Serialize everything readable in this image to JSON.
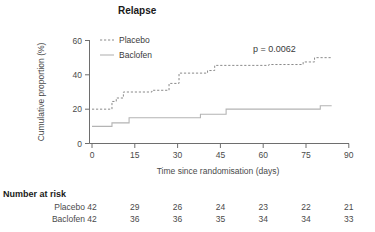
{
  "figure": {
    "title": "Relapse",
    "p_value_label": "p = 0.0062"
  },
  "axes": {
    "y_label": "Cumulative proportion (%)",
    "x_label": "Time since randomisation (days)",
    "y_ticks": [
      "0",
      "20",
      "40",
      "60"
    ],
    "x_ticks": [
      "0",
      "15",
      "30",
      "45",
      "60",
      "75",
      "90"
    ]
  },
  "legend": {
    "items": [
      {
        "label": "Placebo",
        "style": "dashed",
        "color": "#8a8a8a"
      },
      {
        "label": "Baclofen",
        "style": "solid",
        "color": "#b4b4b4"
      }
    ]
  },
  "risk_table": {
    "heading": "Number at risk",
    "rows": [
      {
        "label": "Placebo",
        "values": [
          "42",
          "29",
          "26",
          "24",
          "23",
          "22",
          "21"
        ]
      },
      {
        "label": "Baclofen",
        "values": [
          "42",
          "36",
          "36",
          "35",
          "34",
          "34",
          "33"
        ]
      }
    ]
  },
  "chart_data": {
    "type": "line",
    "subtype": "kaplan-meier-cumulative-incidence",
    "title": "Relapse",
    "xlabel": "Time since randomisation (days)",
    "ylabel": "Cumulative proportion (%)",
    "xlim": [
      0,
      90
    ],
    "ylim": [
      0,
      60
    ],
    "xticks": [
      0,
      15,
      30,
      45,
      60,
      75,
      90
    ],
    "yticks": [
      0,
      20,
      40,
      60
    ],
    "grid": false,
    "legend_position": "top-left-inside",
    "annotations": [
      {
        "text": "p = 0.0062",
        "x": 62,
        "y": 56
      }
    ],
    "series": [
      {
        "name": "Placebo",
        "style": "dashed",
        "color": "#8a8a8a",
        "steps": [
          [
            0,
            20.0
          ],
          [
            7,
            20.0
          ],
          [
            7,
            24.5
          ],
          [
            8.5,
            24.5
          ],
          [
            8.5,
            26.5
          ],
          [
            11,
            26.5
          ],
          [
            11,
            30.0
          ],
          [
            21,
            30.0
          ],
          [
            21,
            31.0
          ],
          [
            27,
            31.0
          ],
          [
            27,
            35.0
          ],
          [
            30.5,
            35.0
          ],
          [
            30.5,
            41.0
          ],
          [
            40.5,
            41.0
          ],
          [
            40.5,
            42.5
          ],
          [
            43,
            42.5
          ],
          [
            43,
            45.5
          ],
          [
            62,
            45.5
          ],
          [
            62,
            46.0
          ],
          [
            74,
            46.0
          ],
          [
            74,
            47.5
          ],
          [
            78,
            47.5
          ],
          [
            78,
            50.0
          ],
          [
            84,
            50.0
          ]
        ]
      },
      {
        "name": "Baclofen",
        "style": "solid",
        "color": "#b4b4b4",
        "steps": [
          [
            0,
            10.0
          ],
          [
            7,
            10.0
          ],
          [
            7,
            12.0
          ],
          [
            13,
            12.0
          ],
          [
            13,
            15.0
          ],
          [
            38,
            15.0
          ],
          [
            38,
            17.0
          ],
          [
            47,
            17.0
          ],
          [
            47,
            20.0
          ],
          [
            80,
            20.0
          ],
          [
            80,
            22.0
          ],
          [
            84,
            22.0
          ]
        ]
      }
    ],
    "number_at_risk": {
      "times": [
        0,
        15,
        30,
        45,
        60,
        75,
        90
      ],
      "rows": [
        {
          "name": "Placebo",
          "counts": [
            42,
            29,
            26,
            24,
            23,
            22,
            21
          ]
        },
        {
          "name": "Baclofen",
          "counts": [
            42,
            36,
            36,
            35,
            34,
            34,
            33
          ]
        }
      ]
    }
  }
}
